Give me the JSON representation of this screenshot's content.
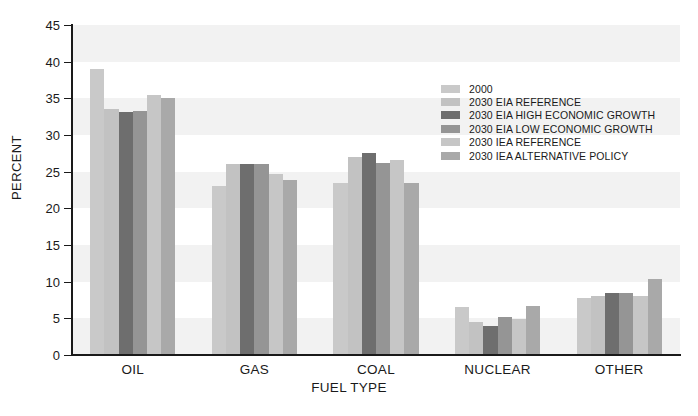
{
  "chart_data": {
    "type": "bar",
    "title": "",
    "xlabel": "FUEL TYPE",
    "ylabel": "PERCENT",
    "ylim": [
      0,
      45
    ],
    "yticks": [
      0,
      5,
      10,
      15,
      20,
      25,
      30,
      35,
      40,
      45
    ],
    "grid": "alternating horizontal bands",
    "legend_position": "inside upper right",
    "categories": [
      "OIL",
      "GAS",
      "COAL",
      "NUCLEAR",
      "OTHER"
    ],
    "series": [
      {
        "name": "2000",
        "color": "#c9c9c9",
        "values": [
          39.0,
          23.0,
          23.5,
          6.6,
          7.8
        ]
      },
      {
        "name": "2030 EIA REFERENCE",
        "color": "#c2c2c2",
        "values": [
          33.5,
          26.0,
          27.0,
          4.5,
          8.1
        ]
      },
      {
        "name": "2030 EIA HIGH ECONOMIC GROWTH",
        "color": "#6e6e6e",
        "values": [
          33.2,
          26.1,
          27.5,
          3.9,
          8.5
        ]
      },
      {
        "name": "2030 EIA LOW ECONOMIC GROWTH",
        "color": "#959595",
        "values": [
          33.3,
          26.1,
          26.2,
          5.2,
          8.4
        ]
      },
      {
        "name": "2030 IEA REFERENCE",
        "color": "#c6c6c6",
        "values": [
          35.5,
          24.7,
          26.6,
          4.9,
          8.0
        ]
      },
      {
        "name": "2030 IEA ALTERNATIVE POLICY",
        "color": "#a9a9a9",
        "values": [
          35.0,
          23.9,
          23.4,
          6.7,
          10.4
        ]
      }
    ]
  },
  "axis": {
    "y_title": "PERCENT",
    "x_title": "FUEL TYPE"
  },
  "colors": {
    "axis": "#1a1a1a",
    "band": "#f2f2f2",
    "background": "#ffffff"
  }
}
